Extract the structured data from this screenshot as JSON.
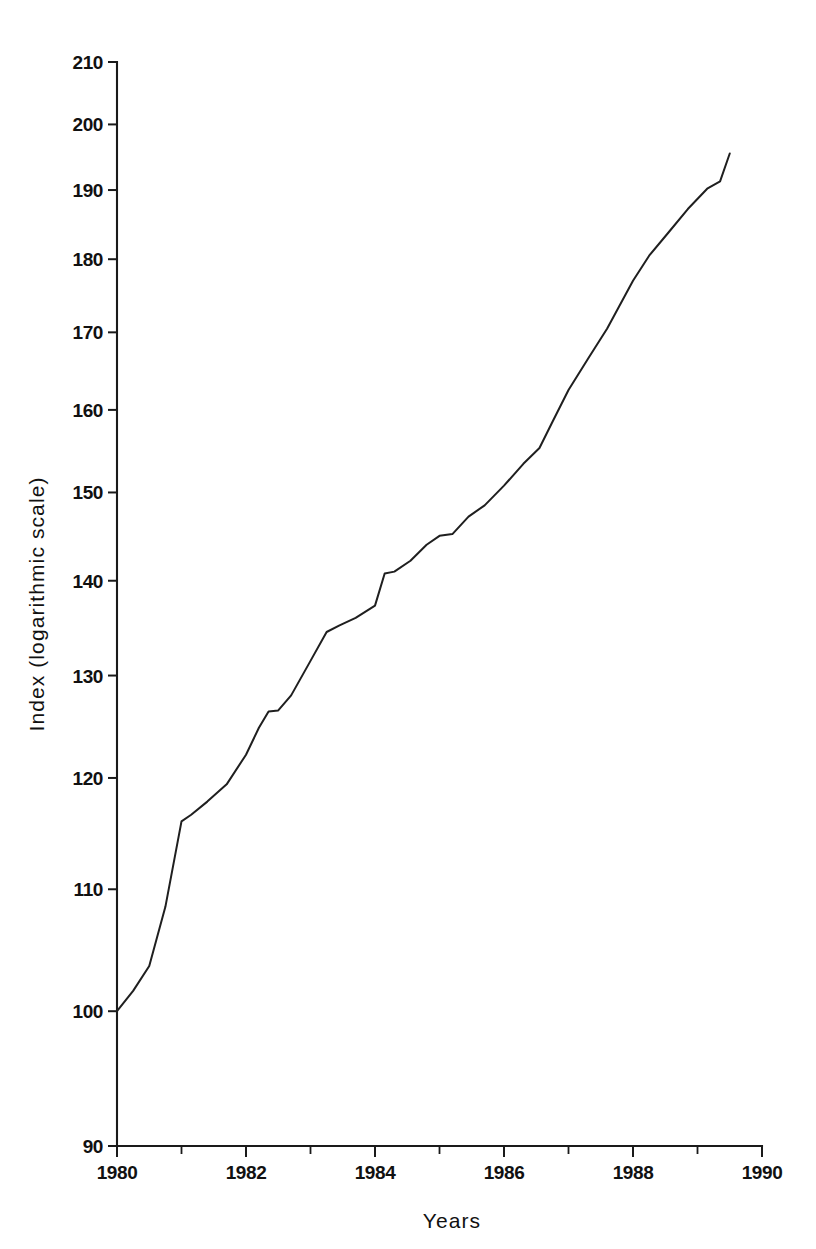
{
  "chart_data": {
    "type": "line",
    "title": "",
    "xlabel": "Years",
    "ylabel": "Index (logarithmic scale)",
    "yscale": "log",
    "xlim": [
      1980,
      1990
    ],
    "ylim": [
      90,
      210
    ],
    "grid": false,
    "legend": false,
    "y_tick_labels": [
      "210",
      "200",
      "190",
      "180",
      "170",
      "160",
      "150",
      "140",
      "130",
      "120",
      "110",
      "100",
      "90"
    ],
    "y_ticks": [
      210,
      200,
      190,
      180,
      170,
      160,
      150,
      140,
      130,
      120,
      110,
      100,
      90
    ],
    "x_tick_labels": [
      "1980",
      "1982",
      "1984",
      "1986",
      "1988",
      "1990"
    ],
    "x_ticks": [
      1980,
      1982,
      1984,
      1986,
      1988,
      1990
    ],
    "x_minor_ticks": [
      1981,
      1983,
      1985,
      1987,
      1989
    ],
    "series": [
      {
        "name": "Index",
        "color": "#1f1f1f",
        "x": [
          1980.0,
          1980.25,
          1980.5,
          1980.75,
          1981.0,
          1981.15,
          1981.4,
          1981.7,
          1982.0,
          1982.2,
          1982.35,
          1982.5,
          1982.7,
          1983.0,
          1983.25,
          1983.45,
          1983.7,
          1984.0,
          1984.15,
          1984.3,
          1984.55,
          1984.8,
          1985.0,
          1985.2,
          1985.45,
          1985.7,
          1986.0,
          1986.3,
          1986.55,
          1986.75,
          1987.0,
          1987.3,
          1987.6,
          1988.0,
          1988.25,
          1988.55,
          1988.85,
          1989.15,
          1989.35,
          1989.5
        ],
        "y": [
          100.0,
          101.6,
          103.6,
          108.5,
          116.0,
          116.6,
          117.8,
          119.4,
          122.2,
          124.8,
          126.4,
          126.5,
          128.0,
          131.5,
          134.5,
          135.2,
          136.0,
          137.3,
          140.8,
          141.0,
          142.2,
          144.0,
          145.0,
          145.2,
          147.2,
          148.5,
          150.8,
          153.4,
          155.3,
          158.5,
          162.5,
          166.5,
          170.5,
          177.0,
          180.5,
          183.8,
          187.2,
          190.2,
          191.3,
          195.5
        ]
      }
    ]
  },
  "axes": {
    "y_title": "Index (logarithmic scale)",
    "x_title": "Years"
  }
}
